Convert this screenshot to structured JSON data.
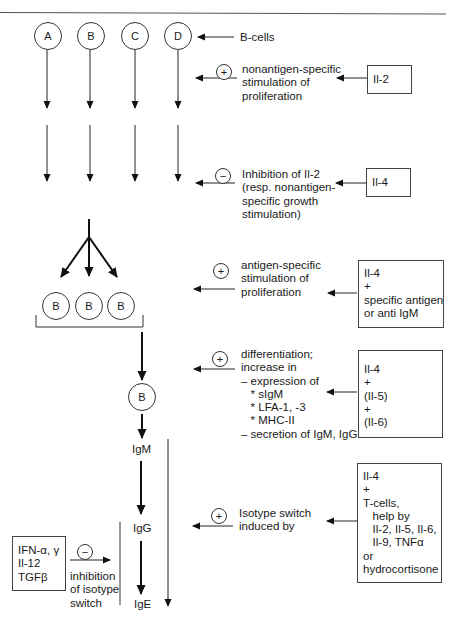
{
  "diagram": {
    "title": "",
    "b_cells": {
      "label": "B-cells",
      "cells": [
        "A",
        "B",
        "C",
        "D"
      ]
    },
    "clonal_cells": [
      "B",
      "B",
      "B"
    ],
    "differentiated_cell": "B",
    "immunoglobulins": {
      "igm": "IgM",
      "igg": "IgG",
      "ige": "IgE"
    },
    "steps": [
      {
        "sign": "+",
        "text": "nonantigen-specific\nstimulation of\nproliferation",
        "factor_box": "Il-2"
      },
      {
        "sign": "−",
        "text": "Inhibition of Il-2\n(resp. nonantigen-\nspecific growth\nstimulation)",
        "factor_box": "Il-4"
      },
      {
        "sign": "+",
        "text": "antigen-specific\nstimulation of\nproliferation",
        "factor_box": "Il-4\n+\nspecific antigen\nor anti IgM"
      },
      {
        "sign": "+",
        "text": "differentiation;\nincrease in\n– expression of\n   * sIgM\n   * LFA-1, -3\n   * MHC-II\n– secretion of IgM, IgG",
        "factor_box": "Il-4\n+\n(Il-5)\n+\n(Il-6)"
      },
      {
        "sign": "+",
        "text": "Isotype switch\ninduced by",
        "factor_box": "Il-4\n+\nT-cells,\n   help by\n   Il-2, Il-5, Il-6,\n   Il-9, TNFα\nor\nhydrocortisone"
      }
    ],
    "inhibition": {
      "sign": "−",
      "factor_box": "IFN-α, γ\nIl-12\nTGFβ",
      "text": "inhibition\nof isotype\nswitch"
    }
  }
}
